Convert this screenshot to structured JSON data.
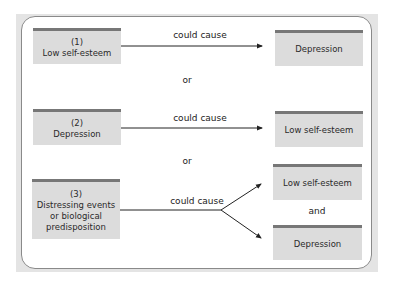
{
  "diagram": {
    "rows": [
      {
        "cause": {
          "number": "(1)",
          "text": "Low self-esteem"
        },
        "relation": "could cause",
        "effects": [
          "Depression"
        ]
      },
      {
        "cause": {
          "number": "(2)",
          "text": "Depression"
        },
        "relation": "could cause",
        "effects": [
          "Low self-esteem"
        ]
      },
      {
        "cause": {
          "number": "(3)",
          "text_lines": [
            "Distressing events",
            "or biological",
            "predisposition"
          ]
        },
        "relation": "could cause",
        "effects": [
          "Low self-esteem",
          "Depression"
        ],
        "effects_joiner": "and"
      }
    ],
    "separators": [
      "or",
      "or"
    ]
  },
  "colors": {
    "box_fill": "#dcdcdc",
    "box_top_bar": "#777777",
    "frame": "#e4e4e4",
    "panel_border": "#8a8a8a"
  }
}
